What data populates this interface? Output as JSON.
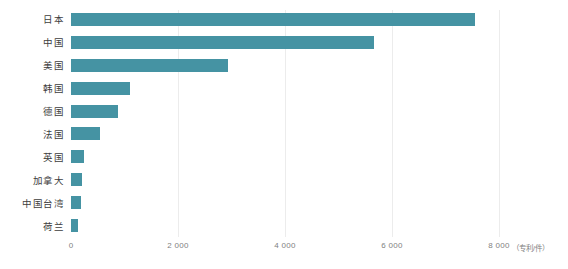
{
  "colors": {
    "background": "#ffffff",
    "bar": "#4593A3",
    "gridline": "#ececec",
    "category_text": "#3d3d3d",
    "tick_text": "#7f7f7f"
  },
  "chart_data": {
    "type": "bar",
    "orientation": "horizontal",
    "title": "",
    "xlabel": "",
    "ylabel": "",
    "unit_label": "（专利/件）",
    "categories": [
      "日本",
      "中国",
      "美国",
      "韩国",
      "德国",
      "法国",
      "英国",
      "加拿大",
      "中国台湾",
      "荷兰"
    ],
    "values": [
      7550,
      5660,
      2930,
      1110,
      880,
      540,
      240,
      200,
      180,
      140
    ],
    "xlim": [
      0,
      8000
    ],
    "xticks": [
      0,
      2000,
      4000,
      6000,
      8000
    ],
    "xtick_labels": [
      "0",
      "2 000",
      "4 000",
      "6 000",
      "8 000"
    ],
    "grid": "vertical-light",
    "legend": "none",
    "bar_color": "#4593A3"
  }
}
